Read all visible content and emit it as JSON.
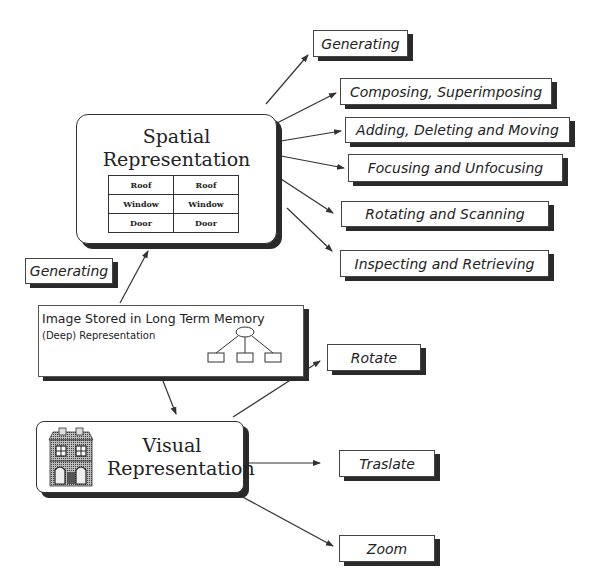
{
  "spatial": {
    "title_line1": "Spatial",
    "title_line2": "Representation",
    "table": [
      [
        "Roof",
        "Roof"
      ],
      [
        "Window",
        "Window"
      ],
      [
        "Door",
        "Door"
      ]
    ]
  },
  "spatial_operations": [
    "Generating",
    "Composing, Superimposing",
    "Adding, Deleting and Moving",
    "Focusing and Unfocusing",
    "Rotating and Scanning",
    "Inspecting and Retrieving"
  ],
  "generating_left": "Generating",
  "long_term_memory": {
    "title": "Image Stored in Long Term Memory",
    "subtitle": "(Deep) Representation",
    "icon": "tree-hierarchy-icon"
  },
  "visual": {
    "title_line1": "Visual",
    "title_line2": "Representation",
    "icon": "house-icon"
  },
  "visual_operations": [
    "Rotate",
    "Traslate",
    "Zoom"
  ]
}
